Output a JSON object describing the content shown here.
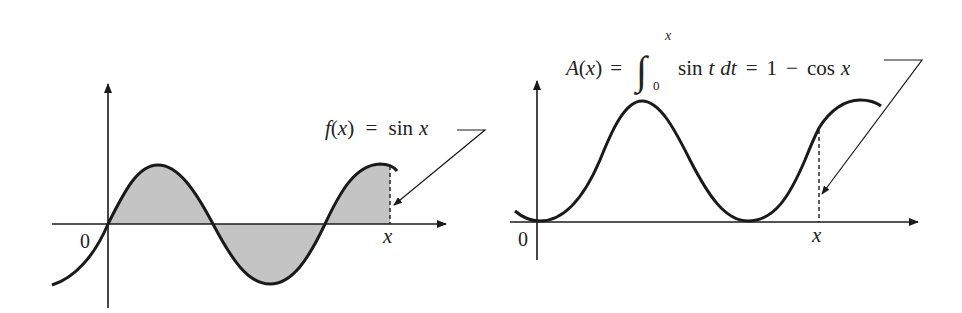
{
  "colors": {
    "stroke": "#1a1a1a",
    "shade": "#c4c4c4",
    "background": "#ffffff",
    "text": "#222222"
  },
  "left_panel": {
    "origin_label": "0",
    "x_label": "x",
    "curve_label": {
      "f": "f",
      "paren_open": "(",
      "var": "x",
      "paren_close": ")",
      "equals": " = ",
      "fn": "sin",
      "arg": "x"
    },
    "description": "Graph of f(x) = sin x with the signed area from 0 to x shaded"
  },
  "right_panel": {
    "origin_label": "0",
    "x_label": "x",
    "curve_label": {
      "A": "A",
      "paren_open": "(",
      "var": "x",
      "paren_close": ")",
      "equals1": "=",
      "integral": "∫",
      "lower_limit": "0",
      "upper_limit": "x",
      "integrand_fn": "sin",
      "integrand_var": "t",
      "differential": "dt",
      "equals2": "=",
      "one": "1",
      "minus": "−",
      "fn": "cos",
      "arg": "x"
    },
    "description": "Graph of the area function A(x) = 1 − cos x, with the value at x marked by a dashed line"
  }
}
